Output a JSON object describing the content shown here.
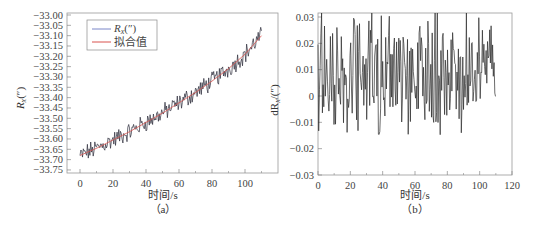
{
  "chart_data": [
    {
      "id": "a",
      "type": "line",
      "caption": "（a）",
      "xlabel": "时间/s",
      "ylabel": "R_x(″)",
      "ylabel_main": "R",
      "ylabel_sub": "x",
      "ylabel_unit": "(″)",
      "xlim": [
        -8,
        120
      ],
      "ylim": [
        -33.76,
        -32.99
      ],
      "xticks": [
        0,
        20,
        40,
        60,
        80,
        100
      ],
      "yticks": [
        -33.0,
        -33.05,
        -33.1,
        -33.15,
        -33.2,
        -33.25,
        -33.3,
        -33.35,
        -33.4,
        -33.45,
        -33.5,
        -33.55,
        -33.6,
        -33.65,
        -33.7,
        -33.75
      ],
      "ytick_labels": [
        "-33.00",
        "-33.05",
        "-33.10",
        "-33.15",
        "-33.20",
        "-33.25",
        "-33.30",
        "-33.35",
        "-33.40",
        "-33.45",
        "-33.50",
        "-33.55",
        "-33.60",
        "-33.65",
        "-33.70",
        "-33.75"
      ],
      "grid": false,
      "legend_position": "upper-left",
      "series": [
        {
          "name": "R_x(″)",
          "legend_main": "R",
          "legend_sub": "x",
          "legend_unit": "(″)",
          "color": "#2b2b3a",
          "legend_color": "#7a86c8",
          "description": "noisy measured data, 0–110 s, rising from ≈-33.68 to ≈-33.07",
          "x_start": 0,
          "x_end": 110,
          "y_start": -33.68,
          "y_end": -33.07
        },
        {
          "name": "拟合值",
          "color": "#d9534f",
          "legend_color": "#d9534f",
          "description": "fitted curve (slightly convex)",
          "x": [
            0,
            10,
            20,
            30,
            40,
            50,
            60,
            70,
            80,
            90,
            100,
            110
          ],
          "y": [
            -33.68,
            -33.645,
            -33.605,
            -33.565,
            -33.52,
            -33.475,
            -33.425,
            -33.375,
            -33.32,
            -33.26,
            -33.19,
            -33.1
          ]
        }
      ]
    },
    {
      "id": "b",
      "type": "line",
      "caption": "（b）",
      "xlabel": "时间/s",
      "ylabel": "dR_x/(″)",
      "ylabel_main": "dR",
      "ylabel_sub": "x",
      "ylabel_unit": "/(″)",
      "xlim": [
        0,
        120
      ],
      "ylim": [
        -0.03,
        0.034
      ],
      "xticks": [
        0,
        20,
        40,
        60,
        80,
        100,
        120
      ],
      "yticks": [
        0.03,
        0.02,
        0.01,
        0,
        -0.01,
        -0.02,
        -0.03
      ],
      "ytick_labels": [
        "0.03",
        "0.02",
        "0.01",
        "0",
        "-0.01",
        "-0.02",
        "-0.03"
      ],
      "grid": false,
      "series": [
        {
          "name": "dR_x residual",
          "color": "#2b2b2b",
          "description": "residual noise around ≈0.01, range ≈-0.017 to 0.035, 0–110 s",
          "x_start": 0,
          "x_end": 110,
          "y_min": -0.017,
          "y_max": 0.035,
          "y_mean": 0.009
        }
      ]
    }
  ]
}
